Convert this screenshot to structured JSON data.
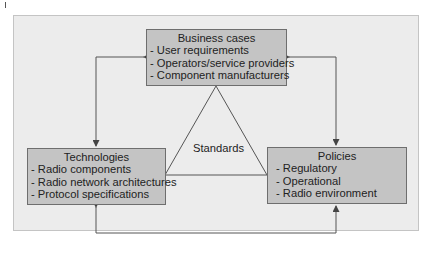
{
  "diagram": {
    "business": {
      "title": "Business cases",
      "items": [
        "- User requirements",
        "- Operators/service providers",
        "- Component manufacturers"
      ]
    },
    "technologies": {
      "title": "Technologies",
      "items": [
        "- Radio components",
        "- Radio network architectures",
        "- Protocol specifications"
      ]
    },
    "policies": {
      "title": "Policies",
      "items": [
        "- Regulatory",
        "- Operational",
        "- Radio environment"
      ]
    },
    "center_label": "Standards",
    "colors": {
      "frame_bg": "#ececec",
      "box_fill": "#c4c4c4",
      "line": "#555555"
    }
  }
}
